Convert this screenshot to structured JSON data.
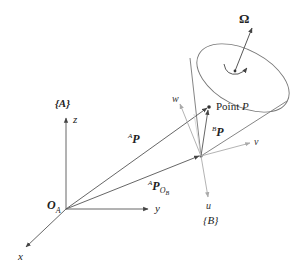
{
  "diagram": {
    "type": "coordinate-frames-rigid-body",
    "colors": {
      "frame_a_axes": "#555555",
      "frame_b_axes": "#aaaaaa",
      "vectors": "#555555",
      "cone_outline": "#777777",
      "text": "#222222"
    },
    "frame_a": {
      "label": "{A}",
      "origin_label": "O",
      "origin_subscript": "A",
      "axes": {
        "x": "x",
        "y": "y",
        "z": "z"
      }
    },
    "frame_b": {
      "label": "{B}",
      "axes": {
        "u": "u",
        "v": "v",
        "w": "w"
      }
    },
    "vectors": {
      "ap": {
        "superscript": "A",
        "symbol": "P"
      },
      "ap_ob": {
        "superscript": "A",
        "symbol": "P",
        "subscript": "O",
        "subsubscript": "B"
      },
      "bp": {
        "superscript": "B",
        "symbol": "P"
      }
    },
    "point": {
      "label_prefix": "Point ",
      "label_var": "P"
    },
    "angular_velocity": {
      "symbol": "Ω"
    }
  }
}
